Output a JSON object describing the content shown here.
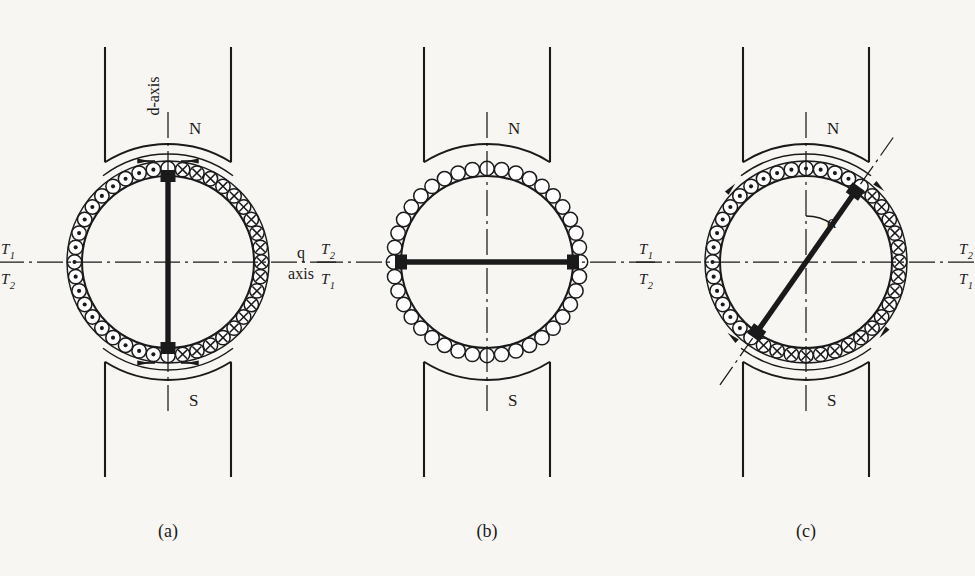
{
  "figure": {
    "background_color": "#f8f6f3",
    "ink_color": "#1a1a1a",
    "panels": [
      {
        "id": "a",
        "caption": "(a)",
        "center": {
          "x": 168,
          "y": 262
        },
        "pole_label_top": "N",
        "pole_label_bottom": "S",
        "axis_label": "d-axis",
        "axis_label_rotated": true,
        "brush_axis_angle_deg": 0,
        "brush_positions_deg": [
          90,
          270
        ],
        "terminal_labels": {
          "left_top": "T",
          "left_top_sub": "1",
          "left_bottom": "T",
          "left_bottom_sub": "2",
          "right_top": "T",
          "right_top_sub": "2",
          "right_bottom": "T",
          "right_bottom_sub": "1"
        },
        "conductor_count": 40,
        "conductor_marks": {
          "left_half": "dot",
          "right_half": "cross"
        },
        "has_outer_armature_ring": true,
        "flux_arrows": true
      },
      {
        "id": "b",
        "caption": "(b)",
        "center": {
          "x": 487,
          "y": 262
        },
        "pole_label_top": "N",
        "pole_label_bottom": "S",
        "axis_label_line1": "q",
        "axis_label_line2": "axis",
        "brush_axis_angle_deg": 90,
        "brush_positions_deg": [
          180,
          0
        ],
        "conductor_count": 40,
        "conductor_marks": {
          "left_half": "none",
          "right_half": "none"
        },
        "has_outer_armature_ring": false,
        "flux_arrows": false
      },
      {
        "id": "c",
        "caption": "(c)",
        "center": {
          "x": 806,
          "y": 262
        },
        "pole_label_top": "N",
        "pole_label_bottom": "S",
        "brush_axis_angle_deg": 35,
        "brush_positions_deg": [
          55,
          235
        ],
        "angle_symbol": "α",
        "terminal_labels": {
          "left_top": "T",
          "left_top_sub": "1",
          "left_bottom": "T",
          "left_bottom_sub": "2",
          "right_top": "T",
          "right_top_sub": "2",
          "right_bottom": "T",
          "right_bottom_sub": "1"
        },
        "conductor_count": 40,
        "conductor_marks": {
          "upper_left": "dot",
          "lower_right": "cross"
        },
        "has_outer_armature_ring": true,
        "flux_arrows": true
      }
    ]
  }
}
